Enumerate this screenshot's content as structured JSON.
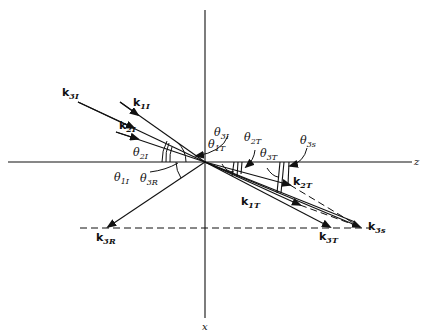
{
  "diagram": {
    "axes": {
      "horizontal_label": "z",
      "vertical_label": "x"
    },
    "incident_waves": [
      {
        "label": "k",
        "sub": "3I"
      },
      {
        "label": "k",
        "sub": "1I"
      },
      {
        "label": "k",
        "sub": "2I"
      }
    ],
    "reflected_waves": [
      {
        "label": "k",
        "sub": "3R"
      }
    ],
    "transmitted_waves": [
      {
        "label": "k",
        "sub": "1T"
      },
      {
        "label": "k",
        "sub": "2T"
      },
      {
        "label": "k",
        "sub": "3T"
      },
      {
        "label": "k",
        "sub": "3s"
      }
    ],
    "angles": [
      {
        "symbol": "θ",
        "sub": "3I"
      },
      {
        "symbol": "θ",
        "sub": "2I"
      },
      {
        "symbol": "θ",
        "sub": "1I"
      },
      {
        "symbol": "θ",
        "sub": "3R"
      },
      {
        "symbol": "θ",
        "sub": "1T"
      },
      {
        "symbol": "θ",
        "sub": "2T"
      },
      {
        "symbol": "θ",
        "sub": "3T"
      },
      {
        "symbol": "θ",
        "sub": "3s"
      }
    ]
  }
}
